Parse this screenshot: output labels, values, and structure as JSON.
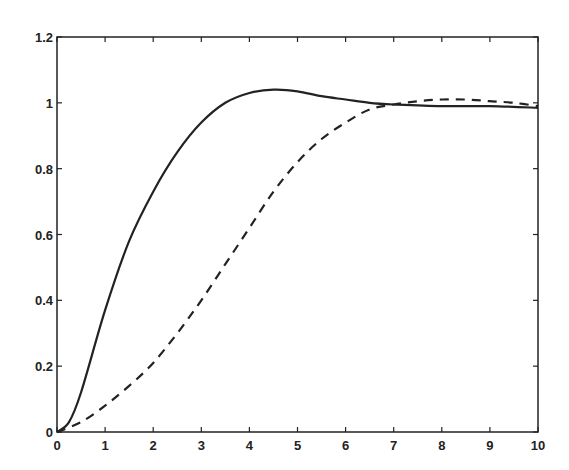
{
  "chart_data": {
    "type": "line",
    "title": "",
    "xlabel": "",
    "ylabel": "",
    "xlim": [
      0,
      10
    ],
    "ylim": [
      0,
      1.2
    ],
    "grid": false,
    "legend": null,
    "xticks": [
      "0",
      "1",
      "2",
      "3",
      "4",
      "5",
      "6",
      "7",
      "8",
      "9",
      "10"
    ],
    "yticks": [
      "0",
      "0.2",
      "0.4",
      "0.6",
      "0.8",
      "1",
      "1.2"
    ],
    "series": [
      {
        "name": "solid",
        "style": "solid",
        "x": [
          0,
          0.25,
          0.5,
          1,
          1.5,
          2,
          2.5,
          3,
          3.5,
          4,
          4.5,
          5,
          5.5,
          6,
          6.5,
          7,
          8,
          9,
          10
        ],
        "values": [
          0,
          0.03,
          0.12,
          0.37,
          0.58,
          0.73,
          0.85,
          0.94,
          1.0,
          1.03,
          1.04,
          1.035,
          1.02,
          1.01,
          1.0,
          0.995,
          0.99,
          0.99,
          0.985
        ]
      },
      {
        "name": "dashed",
        "style": "dashed",
        "x": [
          0,
          0.5,
          1,
          1.5,
          2,
          2.5,
          3,
          3.5,
          4,
          4.5,
          5,
          5.5,
          6,
          6.5,
          7,
          7.5,
          8,
          8.5,
          9,
          9.5,
          10
        ],
        "values": [
          0,
          0.03,
          0.08,
          0.14,
          0.21,
          0.3,
          0.4,
          0.51,
          0.62,
          0.73,
          0.82,
          0.89,
          0.94,
          0.98,
          0.995,
          1.005,
          1.01,
          1.01,
          1.005,
          1.0,
          0.99
        ]
      }
    ]
  }
}
